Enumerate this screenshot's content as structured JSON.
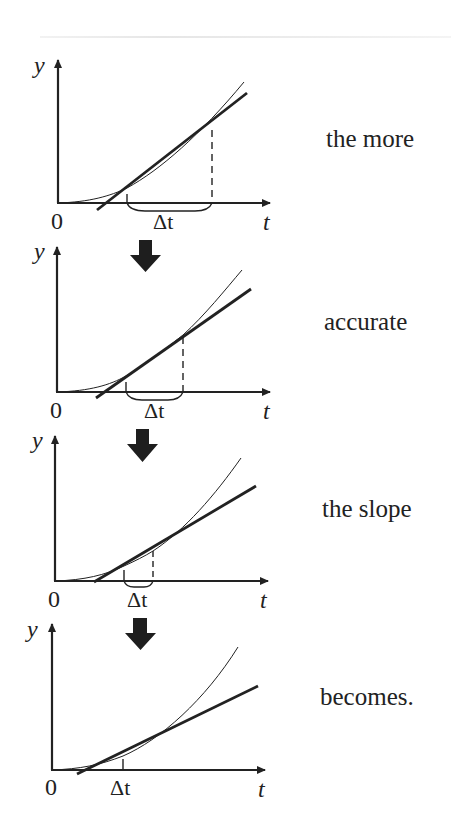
{
  "figure": {
    "axis_labels": {
      "y": "y",
      "x": "t",
      "origin": "0"
    },
    "interval_label": "Δt",
    "panels": [
      {
        "caption": "the more",
        "interval_px": [
          127,
          212
        ],
        "has_brace": true,
        "has_dashed": true
      },
      {
        "caption": "accurate",
        "interval_px": [
          126,
          183
        ],
        "has_brace": true,
        "has_dashed": true
      },
      {
        "caption": "the slope",
        "interval_px": [
          124,
          153
        ],
        "has_brace": true,
        "has_dashed": true
      },
      {
        "caption": "becomes.",
        "interval_px": [
          123,
          123
        ],
        "has_brace": false,
        "has_dashed": false
      }
    ],
    "arrow_color": "#1e1e1e",
    "line_color": "#222222"
  }
}
